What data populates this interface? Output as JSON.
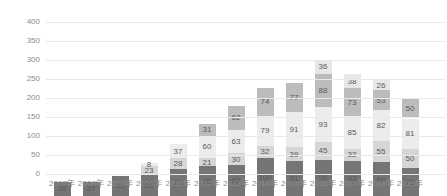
{
  "chart_data": {
    "type": "bar",
    "stacked": true,
    "title": "",
    "xlabel": "",
    "ylabel": "",
    "categories": [
      "2007年",
      "2008年",
      "2009年",
      "2010年",
      "2011年",
      "2012年",
      "2013年",
      "2014年",
      "2015年",
      "2016年",
      "2017年",
      "2018年",
      "2019年"
    ],
    "series": [
      {
        "name": "series-1",
        "color": "#757575",
        "values": [
          38,
          37,
          53,
          56,
          71,
          78,
          82,
          100,
          91,
          96,
          93,
          89,
          73
        ]
      },
      {
        "name": "series-2",
        "color": "#d6d6d6",
        "values": [
          0,
          0,
          0,
          23,
          28,
          21,
          30,
          32,
          39,
          45,
          32,
          55,
          50
        ]
      },
      {
        "name": "series-3",
        "color": "#ececec",
        "values": [
          0,
          0,
          0,
          8,
          37,
          60,
          63,
          79,
          91,
          93,
          85,
          82,
          81
        ]
      },
      {
        "name": "series-4",
        "color": "#bcbcbc",
        "values": [
          0,
          0,
          0,
          0,
          0,
          31,
          62,
          74,
          77,
          88,
          73,
          53,
          50
        ]
      },
      {
        "name": "series-5",
        "color": "#e7e7e7",
        "values": [
          0,
          0,
          0,
          0,
          0,
          0,
          0,
          0,
          0,
          36,
          38,
          26,
          0
        ]
      }
    ],
    "totals": [
      38,
      37,
      53,
      87,
      136,
      190,
      237,
      285,
      298,
      358,
      321,
      305,
      254
    ],
    "ylim": [
      0,
      400
    ],
    "yticks": [
      0,
      50,
      100,
      150,
      200,
      250,
      300,
      350,
      400
    ],
    "grid": true,
    "legend": "none",
    "value_labels": true
  },
  "style": {
    "background": "#ffffff",
    "gridline_color": "#e9e9e9",
    "axis_label_color": "#8c8c8c",
    "value_label_color": "#595959"
  }
}
